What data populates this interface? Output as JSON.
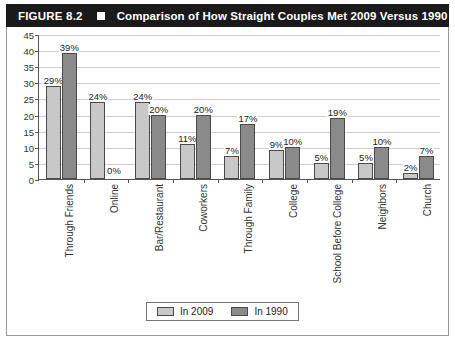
{
  "header": {
    "figure_number": "FIGURE 8.2",
    "separator_icon": "square-icon",
    "title": "Comparison of How Straight Couples Met 2009 Versus 1990"
  },
  "legend": {
    "items": [
      {
        "label": "In 2009",
        "color": "#c8c8c8"
      },
      {
        "label": "In 1990",
        "color": "#8a8a8a"
      }
    ]
  },
  "chart_data": {
    "type": "bar",
    "title": "Comparison of How Straight Couples Met 2009 Versus 1990",
    "xlabel": "",
    "ylabel": "",
    "ylim": [
      0,
      45
    ],
    "ytick_step": 5,
    "yticks": [
      0,
      5,
      10,
      15,
      20,
      25,
      30,
      35,
      40,
      45
    ],
    "ytick_labels": [
      "0",
      "5",
      "10",
      "15",
      "20",
      "25",
      "30",
      "35",
      "40",
      "45"
    ],
    "grid": true,
    "legend_position": "bottom-center",
    "value_suffix": "%",
    "categories": [
      "Through Friends",
      "Online",
      "Bar/Restaurant",
      "Coworkers",
      "Through Family",
      "College",
      "School Before College",
      "Neighbors",
      "Church"
    ],
    "series": [
      {
        "name": "In 2009",
        "color": "#c8c8c8",
        "values": [
          29,
          24,
          24,
          11,
          7,
          9,
          5,
          5,
          2
        ],
        "labels": [
          "29%",
          "24%",
          "24%",
          "11%",
          "7%",
          "9%",
          "5%",
          "5%",
          "2%"
        ]
      },
      {
        "name": "In 1990",
        "color": "#8a8a8a",
        "values": [
          39,
          0,
          20,
          20,
          17,
          10,
          19,
          10,
          7
        ],
        "labels": [
          "39%",
          "0%",
          "20%",
          "20%",
          "17%",
          "10%",
          "19%",
          "10%",
          "7%"
        ]
      }
    ]
  }
}
